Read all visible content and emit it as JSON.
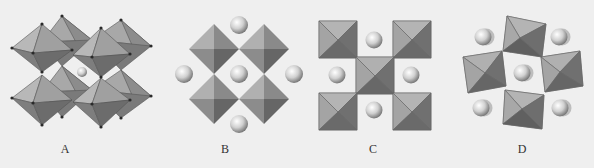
{
  "figure": {
    "panels": [
      {
        "id": "A",
        "label": "A",
        "description": "Perovskite framework of corner-sharing octahedra, perspective view, with one central cation sphere"
      },
      {
        "id": "B",
        "label": "B",
        "description": "Octahedra viewed along body diagonal (diamond projection) with five cation spheres"
      },
      {
        "id": "C",
        "label": "C",
        "description": "Octahedra viewed along axis (square projection), five squares with four spheres"
      },
      {
        "id": "D",
        "label": "D",
        "description": "Tilted octahedra (rotated square projection) with five spheres"
      }
    ]
  },
  "colors": {
    "background": "#efefef",
    "face_light": "#b4b4b4",
    "face_mid": "#8e8e8e",
    "face_dark": "#6a6a6a",
    "edge": "#555555",
    "vertex": "#2a2a2a",
    "sphere": "#d8d8d8"
  }
}
